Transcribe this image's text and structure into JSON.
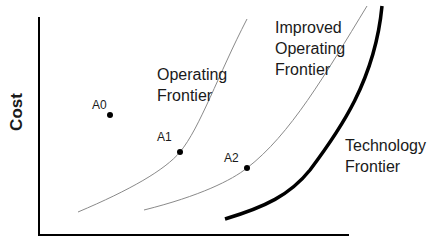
{
  "diagram": {
    "axes": {
      "ylabel": "Cost",
      "xlabel": ""
    },
    "curves": {
      "operating_frontier": {
        "label_line1": "Operating",
        "label_line2": "Frontier",
        "color": "#8a8a8a"
      },
      "improved_operating_frontier": {
        "label_line1": "Improved",
        "label_line2": "Operating",
        "label_line3": "Frontier",
        "color": "#8a8a8a"
      },
      "technology_frontier": {
        "label_line1": "Technology",
        "label_line2": "Frontier",
        "color": "#000000"
      }
    },
    "points": [
      {
        "name": "A0",
        "label": "A0",
        "x": 110,
        "y": 115
      },
      {
        "name": "A1",
        "label": "A1",
        "x": 180,
        "y": 152
      },
      {
        "name": "A2",
        "label": "A2",
        "x": 247,
        "y": 168
      }
    ]
  }
}
